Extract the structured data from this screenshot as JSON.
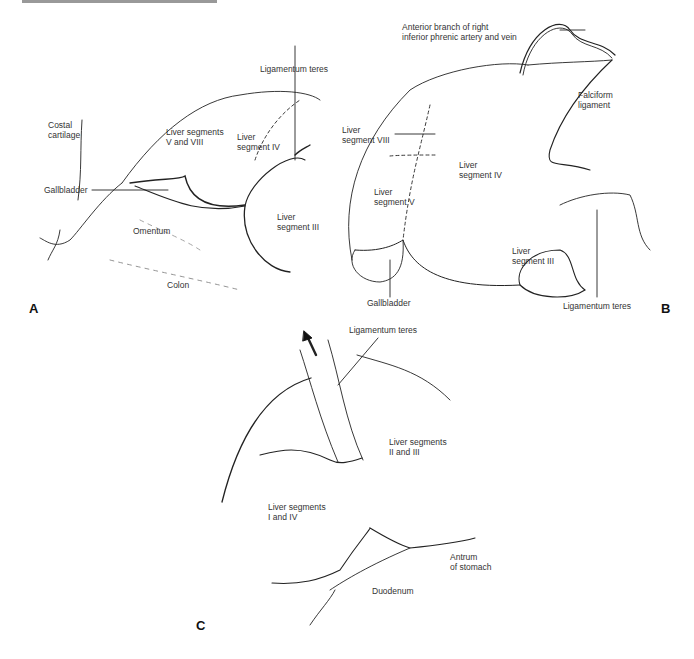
{
  "figure": {
    "panels": [
      {
        "id": "A",
        "letter": "A",
        "labels": {
          "ligamentum_teres": "Ligamentum teres",
          "costal_cartilage": "Costal\ncartilage",
          "liver_v_viii": "Liver segments\nV and VIII",
          "liver_iv": "Liver\nsegment IV",
          "gallbladder": "Gallbladder",
          "liver_iii": "Liver\nsegment III",
          "omentum": "Omentum",
          "colon": "Colon"
        }
      },
      {
        "id": "B",
        "letter": "B",
        "labels": {
          "phrenic": "Anterior branch of right\ninferior phrenic artery and vein",
          "falciform": "Falciform\nligament",
          "liver_viii": "Liver\nsegment VIII",
          "liver_iv": "Liver\nsegment IV",
          "liver_v": "Liver\nsegment V",
          "liver_iii": "Liver\nsegment III",
          "gallbladder": "Gallbladder",
          "ligamentum_teres": "Ligamentum teres"
        }
      },
      {
        "id": "C",
        "letter": "C",
        "labels": {
          "ligamentum_teres": "Ligamentum teres",
          "liver_ii_iii": "Liver segments\nII and III",
          "liver_i_iv": "Liver segments\nI and IV",
          "antrum": "Antrum\nof stomach",
          "duodenum": "Duodenum"
        }
      }
    ]
  }
}
